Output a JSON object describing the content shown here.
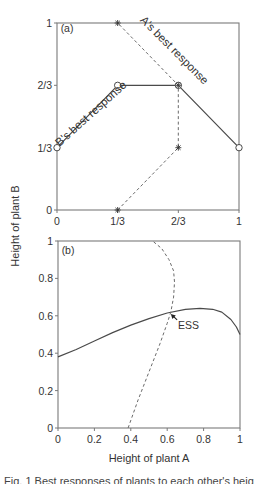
{
  "figure": {
    "ylabel_shared": "Height of plant B",
    "caption_fragment": "Fig. 1 Best responses of plants to each other's height"
  },
  "colors": {
    "axis": "#7a7a7a",
    "line": "#4a4a4a",
    "dashed": "#6a6a6a",
    "text": "#333333"
  },
  "chart_data": [
    {
      "panel": "(a)",
      "type": "line",
      "title": "",
      "xlabel": "",
      "ylabel": "Height of plant B",
      "xlim": [
        0,
        1
      ],
      "ylim": [
        0,
        1
      ],
      "x_ticks": [
        {
          "value": 0,
          "label": "0"
        },
        {
          "value": 0.3333,
          "label": "1/3"
        },
        {
          "value": 0.6667,
          "label": "2/3"
        },
        {
          "value": 1,
          "label": "1"
        }
      ],
      "y_ticks": [
        {
          "value": 0,
          "label": "0"
        },
        {
          "value": 0.3333,
          "label": "1/3"
        },
        {
          "value": 0.6667,
          "label": "2/3"
        },
        {
          "value": 1,
          "label": "1"
        }
      ],
      "grid": false,
      "series": [
        {
          "name": "B's best response",
          "style": "solid",
          "marker": "open-circle",
          "points": [
            [
              0,
              0.3333
            ],
            [
              0.3333,
              0.6667
            ],
            [
              0.6667,
              0.6667
            ],
            [
              1,
              0.3333
            ]
          ]
        },
        {
          "name": "A's best response",
          "style": "dashed",
          "marker": "asterisk",
          "points": [
            [
              0.3333,
              0
            ],
            [
              0.6667,
              0.3333
            ],
            [
              0.6667,
              0.6667
            ],
            [
              0.3333,
              1
            ]
          ]
        }
      ],
      "annotations": [
        {
          "text": "(a)",
          "x": 0.02,
          "y": 0.95
        },
        {
          "text": "A's best response",
          "x": 0.63,
          "y": 0.84,
          "rotation": 45
        },
        {
          "text": "B's best response",
          "x": 0.2,
          "y": 0.5,
          "rotation": -42
        }
      ]
    },
    {
      "panel": "(b)",
      "type": "line",
      "title": "",
      "xlabel": "Height of plant A",
      "ylabel": "Height of plant B",
      "xlim": [
        0,
        1
      ],
      "ylim": [
        0,
        1
      ],
      "x_ticks": [
        {
          "value": 0,
          "label": "0"
        },
        {
          "value": 0.2,
          "label": "0.2"
        },
        {
          "value": 0.4,
          "label": "0.4"
        },
        {
          "value": 0.6,
          "label": "0.6"
        },
        {
          "value": 0.8,
          "label": "0.8"
        },
        {
          "value": 1,
          "label": "1"
        }
      ],
      "y_ticks": [
        {
          "value": 0,
          "label": "0"
        },
        {
          "value": 0.2,
          "label": "0.2"
        },
        {
          "value": 0.4,
          "label": "0.4"
        },
        {
          "value": 0.6,
          "label": "0.6"
        },
        {
          "value": 0.8,
          "label": "0.8"
        },
        {
          "value": 1,
          "label": "1"
        }
      ],
      "grid": false,
      "series": [
        {
          "name": "B's best response",
          "style": "solid",
          "points": [
            [
              0,
              0.38
            ],
            [
              0.1,
              0.42
            ],
            [
              0.2,
              0.465
            ],
            [
              0.3,
              0.51
            ],
            [
              0.4,
              0.55
            ],
            [
              0.5,
              0.585
            ],
            [
              0.6,
              0.615
            ],
            [
              0.7,
              0.635
            ],
            [
              0.78,
              0.64
            ],
            [
              0.85,
              0.635
            ],
            [
              0.9,
              0.62
            ],
            [
              0.95,
              0.58
            ],
            [
              0.98,
              0.54
            ],
            [
              1,
              0.5
            ]
          ]
        },
        {
          "name": "A's best response",
          "style": "dashed",
          "points": [
            [
              0.385,
              0
            ],
            [
              0.44,
              0.15
            ],
            [
              0.5,
              0.3
            ],
            [
              0.56,
              0.45
            ],
            [
              0.6,
              0.56
            ],
            [
              0.62,
              0.62
            ],
            [
              0.635,
              0.7
            ],
            [
              0.64,
              0.78
            ],
            [
              0.635,
              0.84
            ],
            [
              0.61,
              0.9
            ],
            [
              0.57,
              0.96
            ],
            [
              0.52,
              1
            ]
          ]
        }
      ],
      "annotations": [
        {
          "text": "(b)",
          "x": 0.02,
          "y": 0.93
        },
        {
          "text": "ESS",
          "x": 0.66,
          "y": 0.53,
          "arrow_to": [
            0.62,
            0.61
          ]
        }
      ]
    }
  ]
}
